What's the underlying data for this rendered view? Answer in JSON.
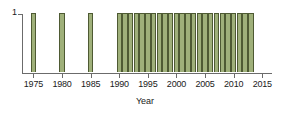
{
  "chart_data": {
    "type": "bar",
    "title": "",
    "xlabel": "Year",
    "ylabel": "",
    "xlim": [
      1973,
      2016
    ],
    "ylim": [
      0,
      1
    ],
    "grid": false,
    "legend": null,
    "bar_color": "#9fb07a",
    "bar_edge_color": "#4e5a33",
    "axis_color": "#6b6b6b",
    "y_ticks": [
      1
    ],
    "y_tick_labels": [
      "1"
    ],
    "x_ticks": [
      1975,
      1980,
      1985,
      1990,
      1995,
      2000,
      2005,
      2010,
      2015
    ],
    "x_tick_labels": [
      "1975",
      "1980",
      "1985",
      "1990",
      "1995",
      "2000",
      "2005",
      "2010",
      "2015"
    ],
    "categories": [
      1975,
      1980,
      1985,
      1990,
      1991,
      1992,
      1993,
      1994,
      1995,
      1996,
      1997,
      1998,
      1999,
      2000,
      2001,
      2002,
      2003,
      2004,
      2005,
      2006,
      2007,
      2008,
      2009,
      2010,
      2011,
      2012,
      2013
    ],
    "values": [
      1,
      1,
      1,
      1,
      1,
      1,
      1,
      1,
      1,
      1,
      1,
      1,
      1,
      1,
      1,
      1,
      1,
      1,
      1,
      1,
      1,
      1,
      1,
      1,
      1,
      1,
      1
    ]
  }
}
